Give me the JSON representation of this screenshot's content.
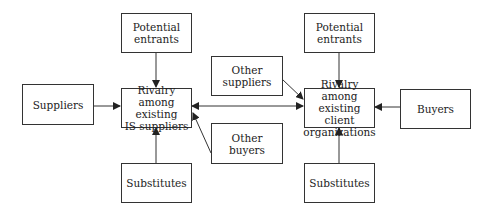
{
  "diagram": {
    "left": {
      "potential_entrants": "Potential\nentrants",
      "suppliers": "Suppliers",
      "rivalry": "Rivalry among\nexisting\nIS suppliers",
      "substitutes": "Substitutes"
    },
    "middle": {
      "other_suppliers": "Other\nsuppliers",
      "other_buyers": "Other\nbuyers"
    },
    "right": {
      "potential_entrants": "Potential\nentrants",
      "buyers": "Buyers",
      "rivalry": "Rivalry among\nexisting client\norganizations",
      "substitutes": "Substitutes"
    },
    "colors": {
      "line": "#333333",
      "background": "#ffffff"
    }
  }
}
